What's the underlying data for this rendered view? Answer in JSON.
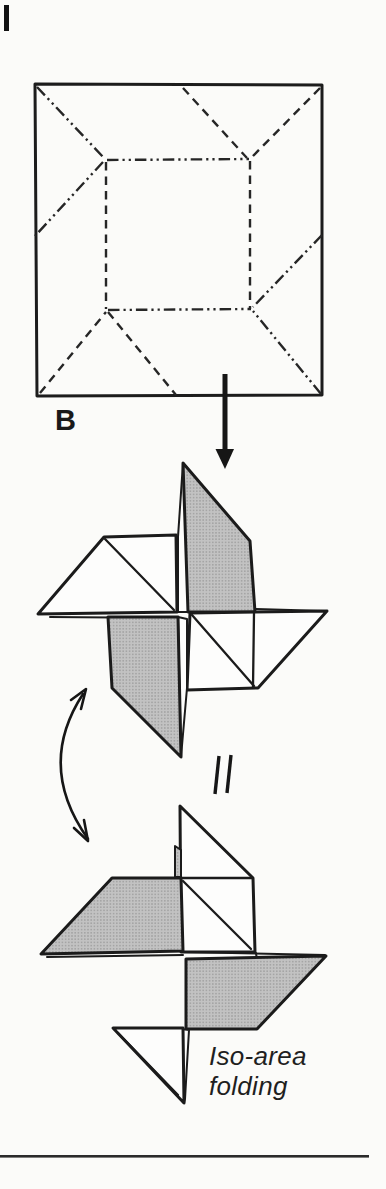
{
  "colors": {
    "ink": "#1c1c1c",
    "paper": "#fbfbf9",
    "shade_halftone": "#b9b9b9",
    "footer_rule": "#2b2b2b"
  },
  "figure": {
    "step_label": "B",
    "equivalence_symbol": "||",
    "caption_line1": "Iso-area",
    "caption_line2": "folding"
  }
}
